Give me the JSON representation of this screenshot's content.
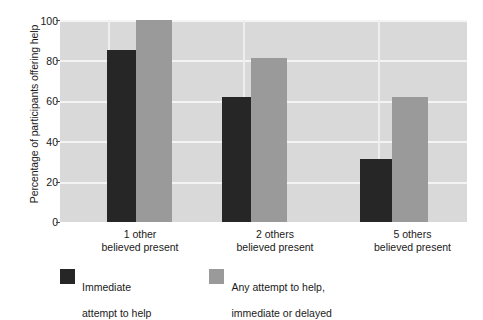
{
  "chart_data": {
    "type": "bar",
    "title": "",
    "xlabel": "",
    "ylabel": "Percentage of participants offering help",
    "ylim": [
      0,
      100
    ],
    "yticks": [
      0,
      20,
      40,
      60,
      80,
      100
    ],
    "ytick_labels": [
      "0",
      "20",
      "40",
      "60",
      "80",
      "100"
    ],
    "grid": true,
    "legend_position": "bottom-left",
    "categories": [
      "1 other\nbelieved present",
      "2 others\nbelieved present",
      "5 others\nbelieved present"
    ],
    "category_lines": [
      {
        "line1": "1 other",
        "line2": "believed present"
      },
      {
        "line1": "2 others",
        "line2": "believed present"
      },
      {
        "line1": "5 others",
        "line2": "believed present"
      }
    ],
    "series": [
      {
        "name": "Immediate\nattempt to help",
        "name_line1": "Immediate",
        "name_line2": "attempt to help",
        "color": "#262626",
        "values": [
          85,
          62,
          31
        ]
      },
      {
        "name": "Any attempt to help,\nimmediate or delayed",
        "name_line1": "Any attempt to help,",
        "name_line2": "immediate or delayed",
        "color": "#9a9a9a",
        "values": [
          100,
          81,
          62
        ]
      }
    ]
  },
  "colors": {
    "plot_background": "#d9d9d9",
    "gridline": "#f4f4f4",
    "dark_series": "#262626",
    "light_series": "#9a9a9a",
    "text": "#1a1a1a",
    "page_background": "#ffffff"
  }
}
